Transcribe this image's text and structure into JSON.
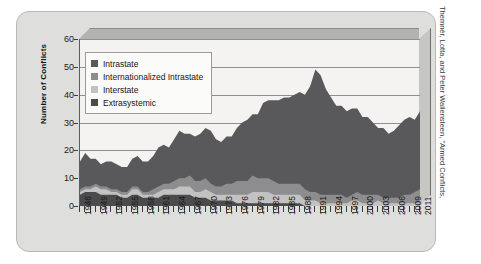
{
  "source_note": "Themnér, Lotta, and Peter Wallensteen, \"Armed Conflicts,",
  "legend": {
    "items": [
      {
        "label": "Intrastate",
        "color": "#59595b"
      },
      {
        "label": "Internationalized Intrastate",
        "color": "#8d8d8f"
      },
      {
        "label": "Interstate",
        "color": "#c2c2c2"
      },
      {
        "label": "Extrasystemic",
        "color": "#4b4b4d"
      }
    ]
  },
  "chart_data": {
    "type": "area",
    "stacked": true,
    "title": "",
    "xlabel": "",
    "ylabel": "Number of Conflicts",
    "ylim": [
      0,
      60
    ],
    "yticks": [
      0,
      10,
      20,
      30,
      40,
      50,
      60
    ],
    "grid": true,
    "legend_position": "top-left",
    "xtick_labels": [
      "1946",
      "1949",
      "1952",
      "1955",
      "1958",
      "1961",
      "1964",
      "1967",
      "1970",
      "1973",
      "1976",
      "1979",
      "1982",
      "1985",
      "1988",
      "1991",
      "1994",
      "1997",
      "2000",
      "2003",
      "2006",
      "2009",
      "2011"
    ],
    "x": [
      1946,
      1947,
      1948,
      1949,
      1950,
      1951,
      1952,
      1953,
      1954,
      1955,
      1956,
      1957,
      1958,
      1959,
      1960,
      1961,
      1962,
      1963,
      1964,
      1965,
      1966,
      1967,
      1968,
      1969,
      1970,
      1971,
      1972,
      1973,
      1974,
      1975,
      1976,
      1977,
      1978,
      1979,
      1980,
      1981,
      1982,
      1983,
      1984,
      1985,
      1986,
      1987,
      1988,
      1989,
      1990,
      1991,
      1992,
      1993,
      1994,
      1995,
      1996,
      1997,
      1998,
      1999,
      2000,
      2001,
      2002,
      2003,
      2004,
      2005,
      2006,
      2007,
      2008,
      2009,
      2010,
      2011
    ],
    "series": [
      {
        "name": "Extrasystemic",
        "color": "#4b4b4d",
        "values": [
          4,
          5,
          5,
          5,
          4,
          4,
          4,
          4,
          3,
          3,
          4,
          4,
          3,
          3,
          3,
          3,
          4,
          4,
          4,
          4,
          4,
          4,
          3,
          3,
          3,
          2,
          2,
          2,
          2,
          2,
          1,
          1,
          1,
          1,
          1,
          1,
          1,
          1,
          1,
          1,
          1,
          1,
          1,
          0,
          0,
          0,
          0,
          0,
          0,
          0,
          0,
          0,
          0,
          0,
          0,
          0,
          0,
          0,
          0,
          0,
          0,
          0,
          0,
          0,
          0,
          0
        ]
      },
      {
        "name": "Interstate",
        "color": "#c2c2c2",
        "values": [
          1,
          1,
          1,
          2,
          2,
          2,
          1,
          1,
          1,
          1,
          2,
          2,
          1,
          1,
          1,
          2,
          2,
          2,
          2,
          3,
          3,
          3,
          2,
          2,
          3,
          3,
          2,
          2,
          2,
          2,
          3,
          3,
          3,
          4,
          4,
          4,
          4,
          3,
          3,
          3,
          3,
          3,
          3,
          2,
          2,
          2,
          1,
          1,
          1,
          1,
          1,
          1,
          2,
          2,
          1,
          1,
          1,
          2,
          1,
          1,
          1,
          1,
          1,
          1,
          1,
          1
        ]
      },
      {
        "name": "Internationalized Intrastate",
        "color": "#8d8d8f",
        "values": [
          1,
          1,
          1,
          1,
          1,
          1,
          1,
          1,
          1,
          1,
          1,
          1,
          1,
          1,
          2,
          2,
          2,
          2,
          3,
          3,
          3,
          4,
          4,
          4,
          4,
          3,
          3,
          3,
          4,
          4,
          5,
          5,
          5,
          6,
          5,
          5,
          5,
          5,
          4,
          4,
          4,
          4,
          4,
          4,
          3,
          3,
          3,
          3,
          3,
          3,
          3,
          2,
          2,
          3,
          3,
          3,
          3,
          2,
          2,
          2,
          2,
          2,
          3,
          3,
          4,
          5
        ]
      },
      {
        "name": "Intrastate",
        "color": "#59595b",
        "values": [
          10,
          12,
          10,
          9,
          8,
          9,
          10,
          9,
          9,
          9,
          10,
          11,
          11,
          11,
          12,
          14,
          14,
          13,
          15,
          17,
          16,
          15,
          16,
          17,
          18,
          19,
          17,
          16,
          17,
          17,
          19,
          21,
          22,
          22,
          23,
          27,
          28,
          29,
          30,
          31,
          31,
          32,
          33,
          34,
          38,
          44,
          43,
          38,
          35,
          32,
          32,
          31,
          31,
          30,
          28,
          28,
          26,
          24,
          25,
          23,
          24,
          26,
          27,
          28,
          26,
          28
        ]
      }
    ],
    "totals": [
      16,
      19,
      17,
      17,
      15,
      16,
      16,
      15,
      14,
      14,
      17,
      18,
      16,
      16,
      18,
      21,
      22,
      21,
      24,
      27,
      26,
      26,
      25,
      26,
      28,
      27,
      24,
      23,
      25,
      25,
      28,
      30,
      31,
      33,
      33,
      37,
      38,
      38,
      38,
      39,
      39,
      40,
      41,
      40,
      43,
      49,
      47,
      42,
      39,
      36,
      36,
      34,
      35,
      35,
      32,
      32,
      30,
      28,
      28,
      26,
      27,
      29,
      31,
      32,
      31,
      34
    ]
  }
}
